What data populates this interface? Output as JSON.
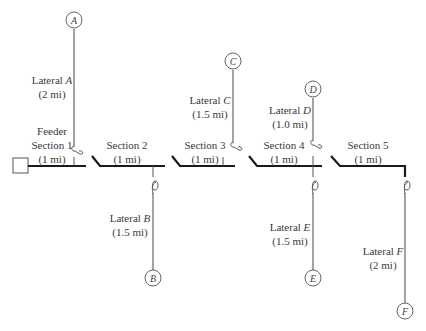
{
  "diagram": {
    "type": "radial distribution feeder",
    "source": {
      "label": ""
    },
    "sections": [
      {
        "id": "section1",
        "line1": "Feeder",
        "line2": "Section 1",
        "length": "(1 mi)"
      },
      {
        "id": "section2",
        "line1": "Section 2",
        "length": "(1 mi)"
      },
      {
        "id": "section3",
        "line1": "Section 3",
        "length": "(1 mi)"
      },
      {
        "id": "section4",
        "line1": "Section 4",
        "length": "(1 mi)"
      },
      {
        "id": "section5",
        "line1": "Section 5",
        "length": "(1 mi)"
      }
    ],
    "laterals": [
      {
        "id": "A",
        "prefix": "Lateral ",
        "letter": "A",
        "length": "(2 mi)",
        "direction": "up"
      },
      {
        "id": "B",
        "prefix": "Lateral ",
        "letter": "B",
        "length": "(1.5 mi)",
        "direction": "down"
      },
      {
        "id": "C",
        "prefix": "Lateral ",
        "letter": "C",
        "length": "(1.5 mi)",
        "direction": "up"
      },
      {
        "id": "D",
        "prefix": "Lateral ",
        "letter": "D",
        "length": "(1.0 mi)",
        "direction": "up"
      },
      {
        "id": "E",
        "prefix": "Lateral ",
        "letter": "E",
        "length": "(1.5 mi)",
        "direction": "down"
      },
      {
        "id": "F",
        "prefix": "Lateral ",
        "letter": "F",
        "length": "(2 mi)",
        "direction": "down"
      }
    ],
    "nodes": [
      "A",
      "B",
      "C",
      "D",
      "E",
      "F"
    ],
    "colors": {
      "feeder": "#1a1a1a",
      "lateral": "#666666",
      "text": "#3a3a3a"
    }
  }
}
